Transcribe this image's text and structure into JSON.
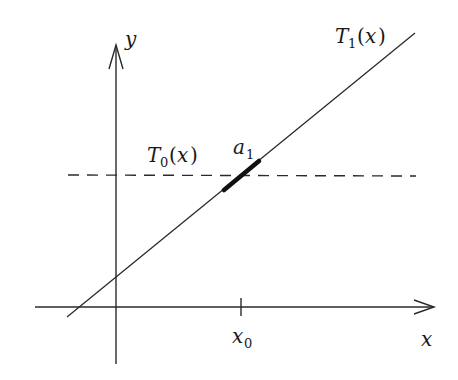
{
  "diagram": {
    "title": "",
    "axes": {
      "x_label": "x",
      "y_label": "y",
      "tick_label": {
        "base": "x",
        "subscript": "0"
      }
    },
    "curves": [
      {
        "name": "T_0(x)",
        "base": "T",
        "subscript": "0",
        "arg": "x",
        "style": "dashed"
      },
      {
        "name": "T_1(x)",
        "base": "T",
        "subscript": "1",
        "arg": "x",
        "style": "solid"
      }
    ],
    "highlight": {
      "base": "a",
      "subscript": "1",
      "style": "thick segment"
    },
    "colors": {
      "stroke": "#1a1a1a",
      "background": "#ffffff"
    }
  }
}
